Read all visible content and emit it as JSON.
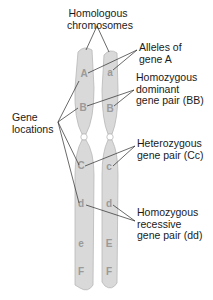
{
  "colors": {
    "chromosome_fill": "#d9d9d9",
    "chromosome_stroke": "#b8b8b8",
    "letter": "#9a9a9a",
    "line": "#2a2a2a",
    "text": "#1a1a1a"
  },
  "labels": {
    "homologous_line1": "Homologous",
    "homologous_line2": "chromosomes",
    "alleles_line1": "Alleles of",
    "alleles_line2": "gene A",
    "dominant_line1": "Homozygous",
    "dominant_line2": "dominant",
    "dominant_line3": "gene pair (BB)",
    "gene_locations_line1": "Gene",
    "gene_locations_line2": "locations",
    "hetero_line1": "Heterozygous",
    "hetero_line2": "gene pair (Cc)",
    "recessive_line1": "Homozygous",
    "recessive_line2": "recessive",
    "recessive_line3": "gene pair (dd)"
  },
  "chromosomes": {
    "left": {
      "genes": [
        "A",
        "B",
        "C",
        "d",
        "e",
        "F"
      ]
    },
    "right": {
      "genes": [
        "a",
        "B",
        "c",
        "d",
        "E",
        "F"
      ]
    }
  }
}
